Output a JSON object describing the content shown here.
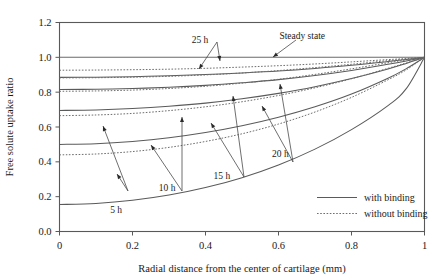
{
  "chart_data": {
    "type": "line",
    "title": "",
    "xlabel": "Radial distance from the center of cartilage (mm)",
    "ylabel": "Free solute uptake ratio",
    "xlim": [
      0,
      1
    ],
    "ylim": [
      0.0,
      1.2
    ],
    "xticks": [
      "0",
      "0.2",
      "0.4",
      "0.6",
      "0.8",
      "1"
    ],
    "xtick_values": [
      0,
      0.2,
      0.4,
      0.6,
      0.8,
      1
    ],
    "yticks": [
      "0.0",
      "0.2",
      "0.4",
      "0.6",
      "0.8",
      "1.0",
      "1.2"
    ],
    "ytick_values": [
      0.0,
      0.2,
      0.4,
      0.6,
      0.8,
      1.0,
      1.2
    ],
    "grid": false,
    "legend_position": "bottom-right",
    "legend": [
      {
        "label": "with binding",
        "style": "solid"
      },
      {
        "label": "without binding",
        "style": "dotted"
      }
    ],
    "x": [
      0,
      0.1,
      0.2,
      0.3,
      0.4,
      0.5,
      0.6,
      0.7,
      0.8,
      0.9,
      0.95,
      1.0
    ],
    "series": [
      {
        "name": "Steady state",
        "style": "solid",
        "annotation": "Steady state",
        "values": [
          1.0,
          1.0,
          1.0,
          1.0,
          1.0,
          1.0,
          1.0,
          1.0,
          1.0,
          1.0,
          1.0,
          1.0
        ]
      },
      {
        "name": "25 h with binding",
        "style": "solid",
        "annotation": "25 h",
        "values": [
          0.885,
          0.886,
          0.889,
          0.894,
          0.901,
          0.91,
          0.921,
          0.936,
          0.954,
          0.976,
          0.988,
          1.0
        ]
      },
      {
        "name": "25 h without binding",
        "style": "dotted",
        "annotation": "25 h",
        "values": [
          0.926,
          0.927,
          0.929,
          0.932,
          0.937,
          0.944,
          0.952,
          0.962,
          0.974,
          0.987,
          0.993,
          1.0
        ]
      },
      {
        "name": "20 h with binding",
        "style": "solid",
        "annotation": "20 h",
        "values": [
          0.815,
          0.817,
          0.821,
          0.828,
          0.839,
          0.854,
          0.872,
          0.896,
          0.925,
          0.96,
          0.979,
          1.0
        ]
      },
      {
        "name": "20 h without binding",
        "style": "dotted",
        "annotation": "20 h",
        "values": [
          0.882,
          0.883,
          0.886,
          0.891,
          0.899,
          0.91,
          0.924,
          0.941,
          0.96,
          0.981,
          0.99,
          1.0
        ]
      },
      {
        "name": "15 h with binding",
        "style": "solid",
        "annotation": "15 h",
        "values": [
          0.695,
          0.698,
          0.706,
          0.719,
          0.737,
          0.762,
          0.793,
          0.831,
          0.878,
          0.933,
          0.965,
          1.0
        ]
      },
      {
        "name": "15 h without binding",
        "style": "dotted",
        "annotation": "15 h",
        "values": [
          0.805,
          0.807,
          0.812,
          0.821,
          0.834,
          0.852,
          0.874,
          0.902,
          0.934,
          0.969,
          0.985,
          1.0
        ]
      },
      {
        "name": "10 h with binding",
        "style": "solid",
        "annotation": "10 h",
        "values": [
          0.5,
          0.504,
          0.517,
          0.538,
          0.568,
          0.607,
          0.656,
          0.716,
          0.789,
          0.88,
          0.935,
          1.0
        ]
      },
      {
        "name": "10 h without binding",
        "style": "dotted",
        "annotation": "10 h",
        "values": [
          0.665,
          0.669,
          0.678,
          0.694,
          0.716,
          0.745,
          0.781,
          0.825,
          0.877,
          0.937,
          0.968,
          1.0
        ]
      },
      {
        "name": "5 h with binding",
        "style": "solid",
        "annotation": "5 h",
        "values": [
          0.155,
          0.161,
          0.179,
          0.209,
          0.252,
          0.309,
          0.382,
          0.473,
          0.585,
          0.723,
          0.82,
          1.0
        ]
      },
      {
        "name": "5 h without binding",
        "style": "dotted",
        "annotation": "5 h",
        "values": [
          0.44,
          0.445,
          0.459,
          0.483,
          0.517,
          0.561,
          0.617,
          0.686,
          0.77,
          0.871,
          0.928,
          1.0
        ]
      }
    ],
    "annotations": [
      {
        "text": "25 h",
        "x": 0.385,
        "y": 1.085
      },
      {
        "text": "Steady state",
        "x": 0.665,
        "y": 1.105
      },
      {
        "text": "20 h",
        "x": 0.605,
        "y": 0.43
      },
      {
        "text": "15 h",
        "x": 0.445,
        "y": 0.3
      },
      {
        "text": "10 h",
        "x": 0.295,
        "y": 0.23
      },
      {
        "text": "5 h",
        "x": 0.155,
        "y": 0.105
      }
    ]
  },
  "figure": {
    "xlabel": "Radial distance from the center of cartilage (mm)",
    "ylabel": "Free solute uptake ratio"
  }
}
